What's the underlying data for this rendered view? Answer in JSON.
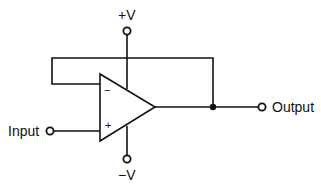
{
  "diagram": {
    "labels": {
      "positive_supply": "+V",
      "negative_supply": "−V",
      "input": "Input",
      "output": "Output",
      "inverting_input": "−",
      "non_inverting_input": "+"
    },
    "colors": {
      "line": "#111111",
      "background": "#ffffff"
    }
  }
}
